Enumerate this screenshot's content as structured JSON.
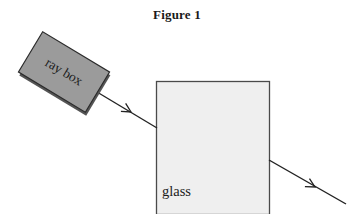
{
  "figure": {
    "title": "Figure 1",
    "caption_position": "top-center"
  },
  "ray_box": {
    "label": "ray box",
    "fill_color": "#9b9b9b",
    "stroke_color": "#2b2b2b",
    "shadow_color": "#555555",
    "rotation_degrees": 31,
    "center": {
      "x": 64,
      "y": 72
    },
    "width": 78,
    "height": 47
  },
  "glass_block": {
    "label": "glass",
    "fill_color": "#efefef",
    "stroke_color": "#4a4a4a",
    "left": 156,
    "top": 81,
    "right": 269,
    "bottom": 214,
    "label_position": {
      "x": 162,
      "y": 196
    }
  },
  "rays": {
    "stroke_color": "#222222",
    "incident": {
      "name": "incident-ray",
      "from": {
        "x": 97,
        "y": 92
      },
      "to": {
        "x": 157,
        "y": 128
      },
      "arrow_at": {
        "x": 131,
        "y": 112
      }
    },
    "emergent": {
      "name": "emergent-ray",
      "from": {
        "x": 269,
        "y": 160
      },
      "to": {
        "x": 346,
        "y": 204
      },
      "arrow_at": {
        "x": 315,
        "y": 187
      }
    }
  },
  "colors": {
    "background": "#ffffff",
    "ink": "#1b1b1b"
  }
}
